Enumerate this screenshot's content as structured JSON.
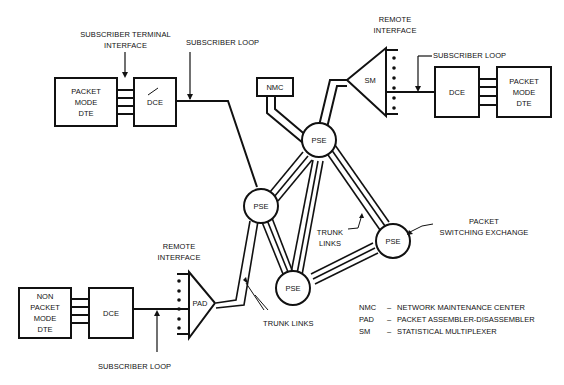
{
  "diagram": {
    "nodes": {
      "dte_top": [
        "PACKET",
        "MODE",
        "DTE"
      ],
      "dce_top": "DCE",
      "nmc": "NMC",
      "sm": "SM",
      "dce_right": "DCE",
      "dte_right": [
        "PACKET",
        "MODE",
        "DTE"
      ],
      "pse": "PSE",
      "dte_bottom": [
        "NON",
        "PACKET",
        "MODE",
        "DTE"
      ],
      "dce_bottom": "DCE",
      "pad": "PAD"
    },
    "labels": {
      "subscriber_terminal_interface": [
        "SUBSCRIBER TERMINAL",
        "INTERFACE"
      ],
      "subscriber_loop": "SUBSCRIBER LOOP",
      "remote_interface": [
        "REMOTE",
        "INTERFACE"
      ],
      "trunk_links_center": [
        "TRUNK",
        "LINKS"
      ],
      "packet_switching_exchange": [
        "PACKET",
        "SWITCHING EXCHANGE"
      ],
      "trunk_links_bottom": "TRUNK LINKS"
    },
    "legend": [
      {
        "abbr": "NMC",
        "dash": "–",
        "text": "NETWORK MAINTENANCE CENTER"
      },
      {
        "abbr": "PAD",
        "dash": "–",
        "text": "PACKET ASSEMBLER-DISASSEMBLER"
      },
      {
        "abbr": "SM",
        "dash": "–",
        "text": "STATISTICAL MULTIPLEXER"
      }
    ]
  }
}
